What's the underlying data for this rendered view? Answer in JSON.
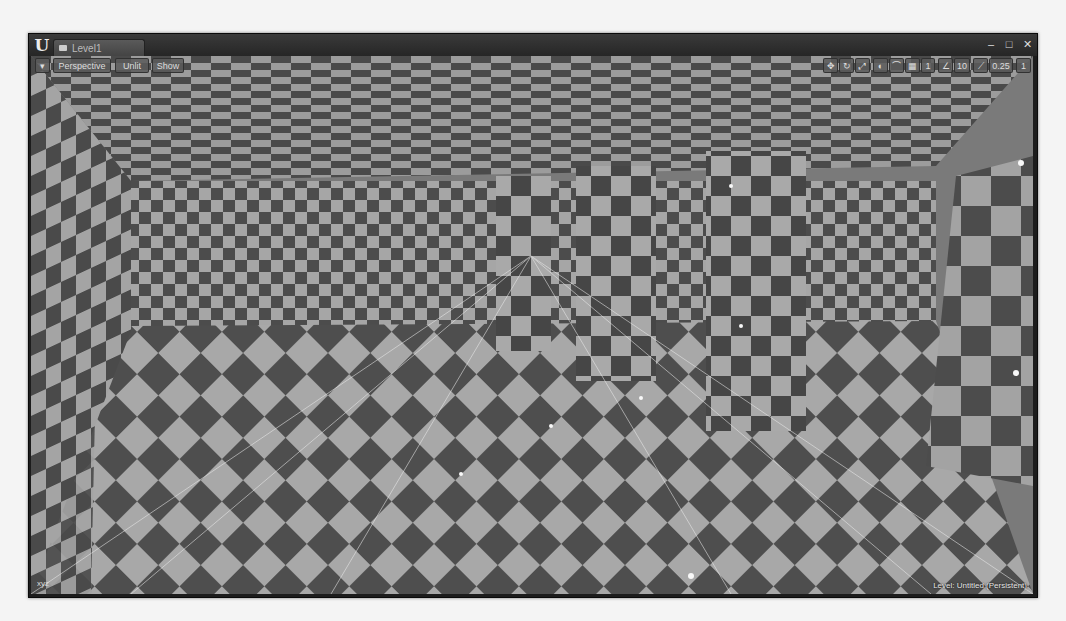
{
  "app": {
    "name": "Unreal Editor",
    "logo_glyph": "U",
    "tab_label": "Level1",
    "window_controls": {
      "minimize": "–",
      "maximize": "□",
      "close": "✕"
    }
  },
  "viewport": {
    "menu_icon": "▾",
    "view_mode_perspective": "Perspective",
    "view_mode_lighting": "Unlit",
    "show_label": "Show",
    "toolbar_right": {
      "translate_icon": "✥",
      "rotate_icon": "↻",
      "scale_icon": "⤢",
      "world_local_icon": "◐",
      "surface_snap_icon": "⌒",
      "grid_snap_icon": "▦",
      "grid_snap_value": "1",
      "rotate_snap_icon": "∠",
      "rotate_snap_value": "10",
      "scale_snap_icon": "⟋",
      "scale_snap_value": "0.25",
      "camera_speed_icon": "▣",
      "camera_speed_value": "1",
      "maximize_icon": "⤢"
    },
    "level_label": "Level:  Untitled (Persistent)",
    "axis_label": "xyz"
  },
  "colors": {
    "checker_light": "#a6a6a6",
    "checker_dark": "#4c4c4c",
    "frame": "#1c1c1c",
    "titlebar": "#2e2e2e"
  }
}
